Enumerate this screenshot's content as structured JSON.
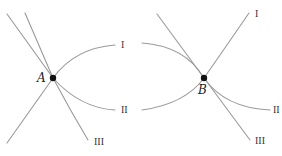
{
  "diagram": {
    "panels": [
      {
        "point": {
          "label": "A",
          "x": 53,
          "y": 78
        },
        "curves": [
          {
            "id": "I",
            "label": "I"
          },
          {
            "id": "II",
            "label": "II"
          },
          {
            "id": "III",
            "label": "III"
          }
        ]
      },
      {
        "point": {
          "label": "B",
          "x": 204,
          "y": 78
        },
        "curves": [
          {
            "id": "I",
            "label": "I"
          },
          {
            "id": "II",
            "label": "II"
          },
          {
            "id": "III",
            "label": "III"
          }
        ]
      }
    ],
    "colors": {
      "curve": "#9a9a9a",
      "point": "#111111"
    }
  }
}
